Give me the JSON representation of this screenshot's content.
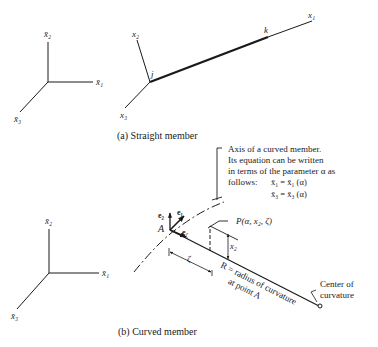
{
  "figure": {
    "panel_a": {
      "caption": "(a) Straight member",
      "global_axes": {
        "x1": "x̄₁",
        "x2": "x̄₂",
        "x3": "x̄₃"
      },
      "local_axes": {
        "x1": "x₁",
        "x2": "x₂",
        "x3": "x₃"
      },
      "node_start": "j",
      "node_end": "k"
    },
    "panel_b": {
      "caption": "(b) Curved member",
      "global_axes": {
        "x1": "x̄₁",
        "x2": "x̄₂",
        "x3": "x̄₃"
      },
      "axis_note": {
        "line1": "Axis of a curved member.",
        "line2": "Its equation can be written",
        "line3": "in terms of the parameter α as",
        "line4": "follows:",
        "eq1": "x̄₁ = x̄₁ (α)",
        "eq2": "x̄₃ = x̄₃ (α)"
      },
      "point_A": "A",
      "vectors": {
        "e2": "e₂",
        "e1": "e₁",
        "ezeta": "e",
        "ezeta_sub": "ζ"
      },
      "point_P": "P(α, x₂, ζ)",
      "dim_x2": "x₂",
      "dim_zeta": "ζ",
      "radius_label_1": "R = radius of curvature",
      "radius_label_2": "at point A",
      "center_label_1": "Center of",
      "center_label_2": "curvature"
    }
  }
}
